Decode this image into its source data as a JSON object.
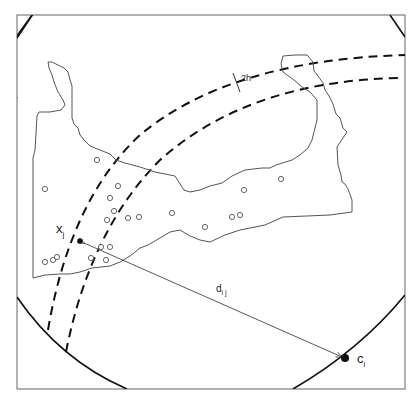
{
  "labels": {
    "point_x": "x",
    "point_x_sub": "j",
    "point_c": "c",
    "point_c_sub": "i",
    "distance": "d",
    "distance_sub": "i j",
    "bandwidth": "2h"
  },
  "colors": {
    "frame": "#555555",
    "circle": "#111111",
    "band": "#111111",
    "polygon": "#555555",
    "points": "#555555"
  },
  "sample_points": [
    [
      97,
      160
    ],
    [
      45,
      189
    ],
    [
      118,
      186
    ],
    [
      110,
      198
    ],
    [
      125,
      199
    ],
    [
      114,
      211
    ],
    [
      128,
      218
    ],
    [
      139,
      217
    ],
    [
      172,
      213
    ],
    [
      205,
      227
    ],
    [
      232,
      217
    ],
    [
      240,
      216
    ],
    [
      244,
      190
    ],
    [
      281,
      179
    ],
    [
      45,
      262
    ],
    [
      53,
      260
    ],
    [
      57,
      257
    ],
    [
      101,
      246
    ],
    [
      110,
      246
    ],
    [
      91,
      258
    ],
    [
      106,
      259
    ]
  ]
}
